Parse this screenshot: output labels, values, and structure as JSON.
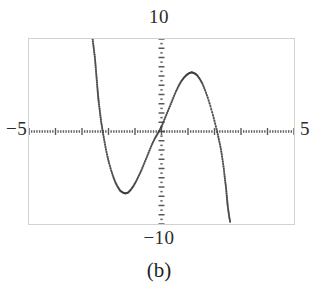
{
  "figure": {
    "caption": "(b)",
    "axis_labels": {
      "x_min": "−5",
      "x_max": "5",
      "y_max": "10",
      "y_min": "−10"
    },
    "frame_color": "#d2d2d2",
    "axis_color": "#3a3a3a",
    "point_color": "#3d3d3d",
    "background": "#ffffff"
  },
  "chart_data": {
    "type": "scatter",
    "title": "",
    "subtitle": "",
    "xlabel": "",
    "ylabel": "",
    "xlim": [
      -5,
      5
    ],
    "ylim": [
      -10,
      10
    ],
    "grid": false,
    "legend": null,
    "style": "dotted-pixel-plot",
    "annotations": [
      {
        "text": "10",
        "position": "top-center",
        "meaning": "y-axis maximum"
      },
      {
        "text": "−10",
        "position": "bottom-center",
        "meaning": "y-axis minimum"
      },
      {
        "text": "−5",
        "position": "left-middle",
        "meaning": "x-axis minimum"
      },
      {
        "text": "5",
        "position": "right-middle",
        "meaning": "x-axis maximum"
      },
      {
        "text": "(b)",
        "position": "below-figure",
        "meaning": "sub-figure caption"
      }
    ],
    "axes": {
      "x_axis_y_value": 0,
      "y_axis_x_value": 0,
      "x_ticks_minor_step": 0.1,
      "x_ticks_major_step": 1,
      "y_ticks_minor_step": 0.5,
      "y_ticks_major_step": 1
    },
    "series": [
      {
        "name": "curve",
        "description": "dotted curve: steep descending branch near x=-2.45, trough near x=-1.35, rise through origin, crest near x=1.15, steep descending branch near x=2.45",
        "x": [
          -2.6,
          -2.57,
          -2.54,
          -2.51,
          -2.49,
          -2.47,
          -2.45,
          -2.43,
          -2.41,
          -2.39,
          -2.37,
          -2.34,
          -2.31,
          -2.28,
          -2.24,
          -2.2,
          -2.15,
          -2.1,
          -2.04,
          -1.98,
          -1.9,
          -1.82,
          -1.74,
          -1.65,
          -1.56,
          -1.46,
          -1.36,
          -1.26,
          -1.16,
          -1.06,
          -0.96,
          -0.86,
          -0.76,
          -0.66,
          -0.56,
          -0.46,
          -0.36,
          -0.26,
          -0.16,
          -0.06,
          0.04,
          0.14,
          0.24,
          0.34,
          0.44,
          0.54,
          0.64,
          0.74,
          0.84,
          0.94,
          1.04,
          1.14,
          1.24,
          1.34,
          1.44,
          1.54,
          1.64,
          1.74,
          1.84,
          1.94,
          2.02,
          2.1,
          2.16,
          2.22,
          2.27,
          2.31,
          2.35,
          2.38,
          2.41,
          2.44,
          2.46,
          2.48,
          2.5,
          2.53,
          2.56,
          2.6
        ],
        "y": [
          10.0,
          9.3,
          8.6,
          7.9,
          7.2,
          6.5,
          5.8,
          5.1,
          4.4,
          3.8,
          3.2,
          2.5,
          1.8,
          1.1,
          0.4,
          -0.3,
          -1.1,
          -1.9,
          -2.7,
          -3.4,
          -4.2,
          -4.9,
          -5.5,
          -6.0,
          -6.4,
          -6.6,
          -6.7,
          -6.6,
          -6.3,
          -5.9,
          -5.4,
          -4.8,
          -4.2,
          -3.5,
          -2.8,
          -2.1,
          -1.4,
          -0.8,
          -0.3,
          0.2,
          0.8,
          1.5,
          2.2,
          2.9,
          3.6,
          4.3,
          4.9,
          5.4,
          5.8,
          6.1,
          6.3,
          6.4,
          6.3,
          6.1,
          5.7,
          5.2,
          4.5,
          3.7,
          2.8,
          1.8,
          0.9,
          0.0,
          -0.8,
          -1.6,
          -2.4,
          -3.2,
          -4.0,
          -4.8,
          -5.5,
          -6.2,
          -6.9,
          -7.5,
          -8.1,
          -8.7,
          -9.3,
          -9.9
        ]
      }
    ]
  }
}
